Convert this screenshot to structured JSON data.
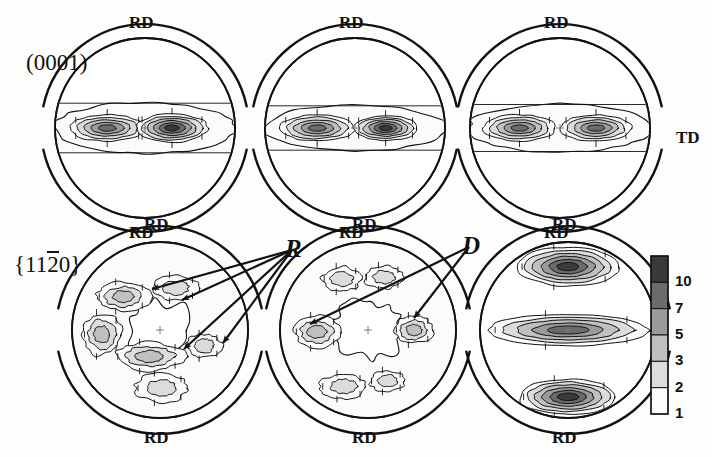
{
  "figure": {
    "kind": "pole-figure-grid",
    "rows": 2,
    "columns": 3,
    "background": "#fdfdfb",
    "line_color": "#111111"
  },
  "row_labels": [
    {
      "id": "row-0001",
      "text_plain": "(0001)",
      "pre": "(0001)"
    },
    {
      "id": "row-1120",
      "pre": "{11",
      "over": "2",
      "post": "0}",
      "text_plain": "{11-20}"
    }
  ],
  "axis_labels": {
    "rd": "RD",
    "td": "TD",
    "rd_top_count": 3,
    "rd_bottom_count": 3
  },
  "annotations": [
    {
      "id": "annot-R",
      "label": "R",
      "x": 292,
      "y": 250,
      "arrow_targets": [
        [
          152,
          289
        ],
        [
          182,
          300
        ],
        [
          184,
          349
        ],
        [
          223,
          343
        ]
      ]
    },
    {
      "id": "annot-D",
      "label": "D",
      "x": 469,
      "y": 247,
      "arrow_targets": [
        [
          310,
          324
        ],
        [
          414,
          318
        ]
      ]
    }
  ],
  "legend": {
    "id": "contour-legend",
    "orientation": "vertical",
    "x": 651,
    "y": 256,
    "width": 17,
    "height": 158,
    "levels": [
      "10",
      "7",
      "5",
      "3",
      "2",
      "1"
    ],
    "swatch_colors": [
      "#3a3a3a",
      "#6b6b6b",
      "#9a9a9a",
      "#c0c0c0",
      "#dcdcdc",
      "#fbfbfb"
    ],
    "unit": "times random"
  },
  "pole_figures": [
    {
      "id": "pf-top-left",
      "row": 0,
      "col": 0,
      "plane": "(0001)",
      "cx": 145,
      "cy": 128,
      "r": 90,
      "outer_r": 104,
      "pattern": "basal-band",
      "peaks": [
        {
          "cx_rel": -0.42,
          "cy_rel": 0.0,
          "rx": 0.42,
          "ry": 0.14,
          "max": 7
        },
        {
          "cx_rel": 0.3,
          "cy_rel": 0.0,
          "rx": 0.4,
          "ry": 0.15,
          "max": 12
        }
      ],
      "band_half_height_rel": 0.19
    },
    {
      "id": "pf-top-mid",
      "row": 0,
      "col": 1,
      "plane": "(0001)",
      "cx": 355,
      "cy": 128,
      "r": 90,
      "outer_r": 104,
      "pattern": "basal-band",
      "peaks": [
        {
          "cx_rel": -0.42,
          "cy_rel": 0.0,
          "rx": 0.42,
          "ry": 0.14,
          "max": 7
        },
        {
          "cx_rel": 0.34,
          "cy_rel": 0.0,
          "rx": 0.36,
          "ry": 0.13,
          "max": 10
        }
      ],
      "band_half_height_rel": 0.17
    },
    {
      "id": "pf-top-right",
      "row": 0,
      "col": 2,
      "plane": "(0001)",
      "cx": 560,
      "cy": 128,
      "r": 90,
      "outer_r": 104,
      "pattern": "basal-band",
      "peaks": [
        {
          "cx_rel": -0.45,
          "cy_rel": 0.0,
          "rx": 0.4,
          "ry": 0.14,
          "max": 8
        },
        {
          "cx_rel": 0.4,
          "cy_rel": 0.0,
          "rx": 0.4,
          "ry": 0.14,
          "max": 8
        }
      ],
      "band_half_height_rel": 0.18
    },
    {
      "id": "pf-bot-left",
      "row": 1,
      "col": 0,
      "plane": "{11-20}",
      "cx": 160,
      "cy": 330,
      "r": 88,
      "outer_r": 104,
      "pattern": "prismatic-spread",
      "blobs": [
        {
          "cx_rel": -0.42,
          "cy_rel": -0.38,
          "rx": 0.3,
          "ry": 0.16,
          "max": 3
        },
        {
          "cx_rel": 0.18,
          "cy_rel": -0.48,
          "rx": 0.26,
          "ry": 0.14,
          "max": 2
        },
        {
          "cx_rel": -0.66,
          "cy_rel": 0.05,
          "rx": 0.22,
          "ry": 0.24,
          "max": 3
        },
        {
          "cx_rel": -0.12,
          "cy_rel": 0.3,
          "rx": 0.4,
          "ry": 0.16,
          "max": 3
        },
        {
          "cx_rel": 0.5,
          "cy_rel": 0.18,
          "rx": 0.2,
          "ry": 0.14,
          "max": 2
        },
        {
          "cx_rel": 0.02,
          "cy_rel": 0.66,
          "rx": 0.3,
          "ry": 0.16,
          "max": 2
        }
      ]
    },
    {
      "id": "pf-bot-mid",
      "row": 1,
      "col": 1,
      "plane": "{11-20}",
      "cx": 368,
      "cy": 330,
      "r": 88,
      "outer_r": 104,
      "pattern": "prismatic-spread",
      "blobs": [
        {
          "cx_rel": -0.58,
          "cy_rel": 0.02,
          "rx": 0.26,
          "ry": 0.18,
          "max": 3
        },
        {
          "cx_rel": 0.52,
          "cy_rel": 0.0,
          "rx": 0.22,
          "ry": 0.16,
          "max": 3
        },
        {
          "cx_rel": -0.3,
          "cy_rel": -0.58,
          "rx": 0.22,
          "ry": 0.14,
          "max": 2
        },
        {
          "cx_rel": 0.18,
          "cy_rel": -0.6,
          "rx": 0.22,
          "ry": 0.13,
          "max": 2
        },
        {
          "cx_rel": -0.28,
          "cy_rel": 0.64,
          "rx": 0.26,
          "ry": 0.14,
          "max": 2
        },
        {
          "cx_rel": 0.22,
          "cy_rel": 0.58,
          "rx": 0.2,
          "ry": 0.12,
          "max": 2
        }
      ]
    },
    {
      "id": "pf-bot-right",
      "row": 1,
      "col": 2,
      "plane": "{11-20}",
      "cx": 568,
      "cy": 330,
      "r": 88,
      "outer_r": 104,
      "pattern": "prismatic-bands",
      "blobs": [
        {
          "cx_rel": 0.0,
          "cy_rel": -0.72,
          "rx": 0.58,
          "ry": 0.22,
          "max": 10
        },
        {
          "cx_rel": 0.0,
          "cy_rel": 0.0,
          "rx": 0.92,
          "ry": 0.18,
          "max": 7
        },
        {
          "cx_rel": 0.0,
          "cy_rel": 0.76,
          "rx": 0.56,
          "ry": 0.2,
          "max": 10
        }
      ]
    }
  ]
}
